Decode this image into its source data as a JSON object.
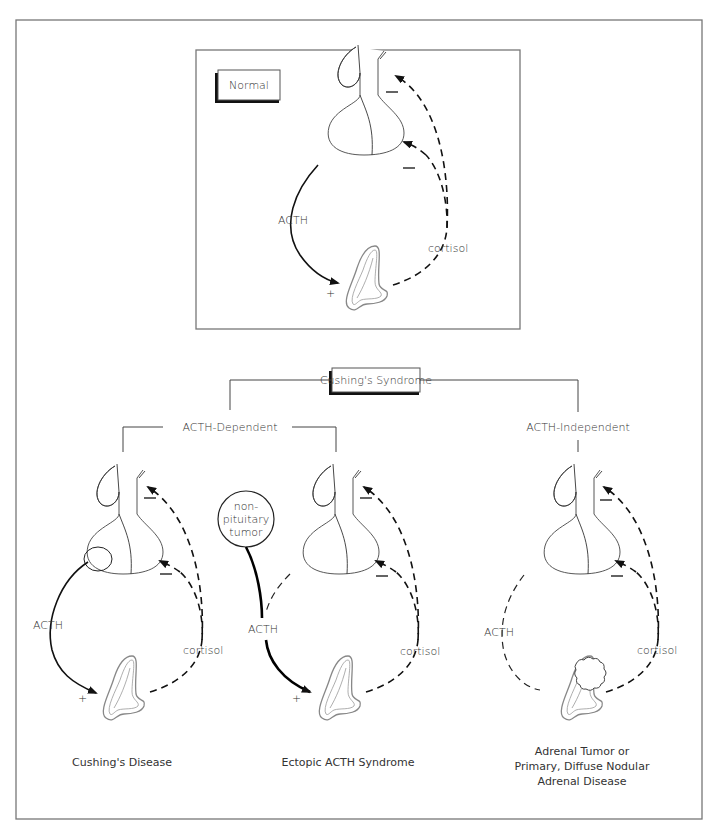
{
  "figure": {
    "title_box_normal": "Normal",
    "title_box_cushing": "Cushing's Syndrome",
    "branches": {
      "dependent": "ACTH-Dependent",
      "independent": "ACTH-Independent"
    },
    "panels": [
      {
        "id": "normal",
        "acth_label": "ACTH",
        "cortisol_label": "cortisol",
        "plus_sign": "+",
        "minus_signs": [
          "–",
          "–"
        ]
      },
      {
        "id": "cushings-disease",
        "acth_label": "ACTH",
        "cortisol_label": "cortisol",
        "plus_sign": "+",
        "caption": "Cushing's Disease"
      },
      {
        "id": "ectopic-acth",
        "acth_label": "ACTH",
        "cortisol_label": "cortisol",
        "plus_sign": "+",
        "tumor_label_lines": [
          "non-",
          "pituitary",
          "tumor"
        ],
        "caption": "Ectopic ACTH Syndrome"
      },
      {
        "id": "acth-independent",
        "acth_label": "ACTH",
        "cortisol_label": "cortisol",
        "caption_lines": [
          "Adrenal Tumor or",
          "Primary, Diffuse Nodular",
          "Adrenal Disease"
        ]
      }
    ]
  },
  "colors": {
    "frame": "#777777",
    "ink": "#111111",
    "text": "#333333",
    "background": "#ffffff"
  }
}
